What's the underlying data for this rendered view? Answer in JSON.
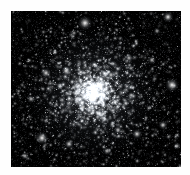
{
  "figure": {
    "kind": "astronomical-image",
    "background_color": "#ffffff",
    "sky_color": "#000000",
    "star_color": "#ffffff",
    "frame": {
      "x": 11,
      "y": 11,
      "width": 170,
      "height": 156
    }
  },
  "chart_data": {
    "type": "scatter",
    "title": "",
    "xlabel": "",
    "ylabel": "",
    "xlim": [
      0,
      170
    ],
    "ylim": [
      0,
      156
    ],
    "grid": false,
    "legend": null,
    "cluster": {
      "center_x": 83,
      "center_y": 82,
      "core_radius": 26,
      "halo_radius": 72,
      "member_count": 2600,
      "field_star_count": 1500
    },
    "bright_stars": [
      {
        "x": 74,
        "y": 12,
        "radius": 3.4,
        "brightness": 1.0,
        "spikes": true
      },
      {
        "x": 157,
        "y": 6,
        "radius": 2.6,
        "brightness": 0.95,
        "spikes": true
      },
      {
        "x": 161,
        "y": 74,
        "radius": 3.2,
        "brightness": 1.0,
        "spikes": true
      },
      {
        "x": 31,
        "y": 127,
        "radius": 3.0,
        "brightness": 1.0,
        "spikes": true
      },
      {
        "x": 35,
        "y": 62,
        "radius": 2.4,
        "brightness": 0.9,
        "spikes": true
      },
      {
        "x": 55,
        "y": 60,
        "radius": 2.2,
        "brightness": 0.85,
        "spikes": false
      },
      {
        "x": 126,
        "y": 123,
        "radius": 2.4,
        "brightness": 0.9,
        "spikes": true
      },
      {
        "x": 107,
        "y": 119,
        "radius": 2.0,
        "brightness": 0.85,
        "spikes": false
      },
      {
        "x": 152,
        "y": 114,
        "radius": 2.2,
        "brightness": 0.88,
        "spikes": false
      },
      {
        "x": 58,
        "y": 133,
        "radius": 2.2,
        "brightness": 0.9,
        "spikes": false
      },
      {
        "x": 141,
        "y": 49,
        "radius": 2.0,
        "brightness": 0.8,
        "spikes": false
      },
      {
        "x": 118,
        "y": 47,
        "radius": 2.0,
        "brightness": 0.8,
        "spikes": false
      },
      {
        "x": 20,
        "y": 88,
        "radius": 1.9,
        "brightness": 0.78,
        "spikes": false
      },
      {
        "x": 96,
        "y": 140,
        "radius": 1.9,
        "brightness": 0.78,
        "spikes": false
      },
      {
        "x": 166,
        "y": 135,
        "radius": 1.8,
        "brightness": 0.75,
        "spikes": false
      },
      {
        "x": 14,
        "y": 145,
        "radius": 1.8,
        "brightness": 0.75,
        "spikes": false
      },
      {
        "x": 146,
        "y": 20,
        "radius": 1.7,
        "brightness": 0.72,
        "spikes": false
      },
      {
        "x": 63,
        "y": 22,
        "radius": 1.6,
        "brightness": 0.7,
        "spikes": false
      },
      {
        "x": 100,
        "y": 64,
        "radius": 2.0,
        "brightness": 0.85,
        "spikes": false
      },
      {
        "x": 72,
        "y": 96,
        "radius": 2.0,
        "brightness": 0.85,
        "spikes": false
      }
    ]
  }
}
